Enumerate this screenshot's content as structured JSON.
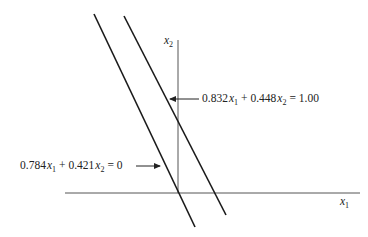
{
  "diagram": {
    "axes": {
      "x1_label": "x",
      "x1_sub": "1",
      "x2_label": "x",
      "x2_sub": "2"
    },
    "lines": [
      {
        "name": "hyperplane-through-origin",
        "equation": {
          "c1": "0.784",
          "v1": "x",
          "s1": "1",
          "plus": "+",
          "c2": "0.421",
          "v2": "x",
          "s2": "2",
          "rhs": "= 0"
        }
      },
      {
        "name": "hyperplane-offset",
        "equation": {
          "c1": "0.832",
          "v1": "x",
          "s1": "1",
          "plus": "+",
          "c2": "0.448",
          "v2": "x",
          "s2": "2",
          "rhs": "= 1.00"
        }
      }
    ],
    "colors": {
      "line": "#1a1a1a",
      "axis": "#555555",
      "text": "#222222"
    }
  }
}
